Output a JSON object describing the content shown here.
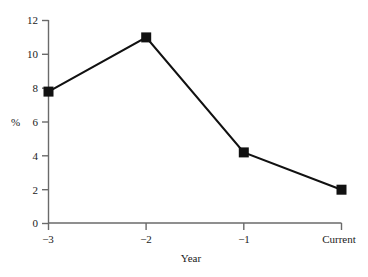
{
  "chart_data": {
    "type": "line",
    "title": "",
    "xlabel": "Year",
    "ylabel": "%",
    "categories": [
      "−3",
      "−2",
      "−1",
      "Current"
    ],
    "values": [
      7.8,
      11.0,
      4.2,
      2.0
    ],
    "series": [
      {
        "name": "",
        "values": [
          7.8,
          11.0,
          4.2,
          2.0
        ]
      }
    ],
    "ylim": [
      0,
      12
    ],
    "yticks": [
      0,
      2,
      4,
      6,
      8,
      10,
      12
    ],
    "ytick_labels": [
      "0",
      "2",
      "4",
      "6",
      "8",
      "10",
      "12"
    ],
    "xtick_labels": [
      "−3",
      "−2",
      "−1",
      "Current"
    ],
    "grid": false,
    "legend": false,
    "legend_position": "none",
    "marker": "square",
    "line_color": "#111111",
    "marker_color": "#111111",
    "axis_color": "#6a6a6a",
    "background_color": "#ffffff"
  },
  "axes": {
    "y": {
      "label": "%",
      "ticks": [
        {
          "value": 12,
          "label": "12"
        },
        {
          "value": 10,
          "label": "10"
        },
        {
          "value": 8,
          "label": "8"
        },
        {
          "value": 6,
          "label": "6"
        },
        {
          "value": 4,
          "label": "4"
        },
        {
          "value": 2,
          "label": "2"
        },
        {
          "value": 0,
          "label": "0"
        }
      ]
    },
    "x": {
      "label": "Year",
      "ticks": [
        {
          "label": "−3"
        },
        {
          "label": "−2"
        },
        {
          "label": "−1"
        },
        {
          "label": "Current"
        }
      ]
    }
  }
}
